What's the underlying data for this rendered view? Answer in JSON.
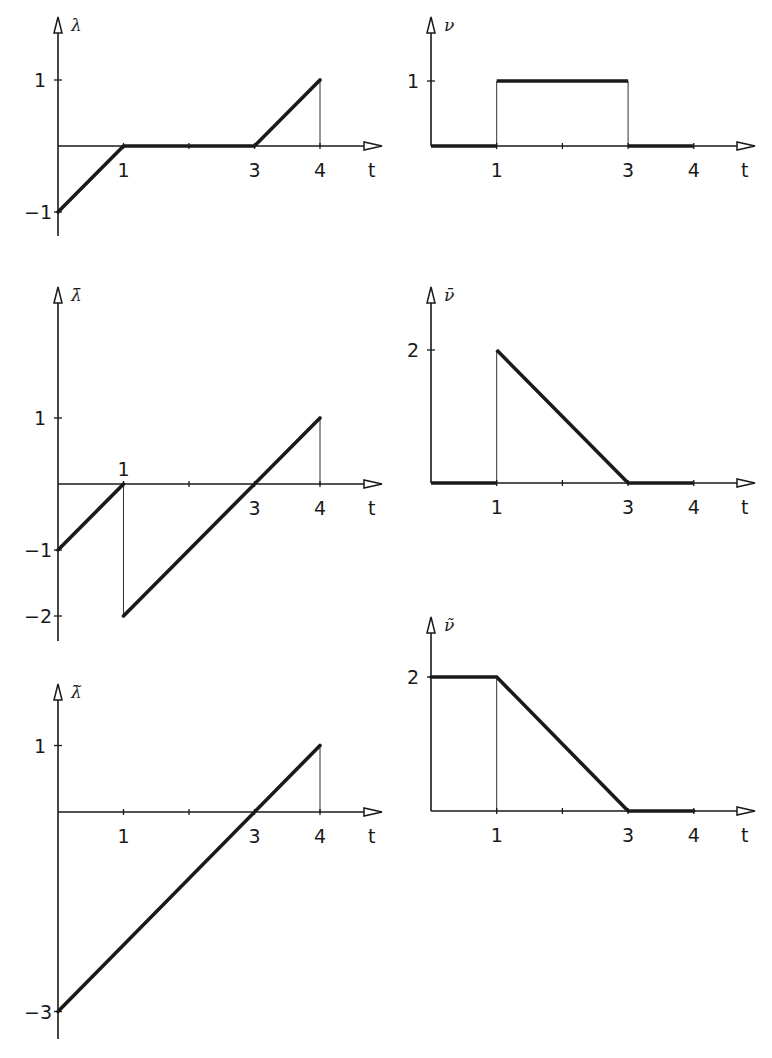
{
  "colors": {
    "ink": "#1a1a1a",
    "background": "#ffffff"
  },
  "chart_data": [
    {
      "id": "lambda",
      "type": "line",
      "title": "",
      "ylabel": "λ",
      "xlabel": "t",
      "x_ticks": [
        1,
        3,
        4
      ],
      "x_tick_labels": [
        "1",
        "3",
        "4"
      ],
      "y_ticks": [
        1,
        -1
      ],
      "y_tick_labels": [
        "1",
        "-1"
      ],
      "xlim": [
        0,
        4
      ],
      "ylim": [
        -1,
        1
      ],
      "x": [
        0,
        1,
        3,
        4
      ],
      "y": [
        -1,
        0,
        0,
        1
      ],
      "guides": [
        {
          "x": 4,
          "from": 0,
          "to": 1
        }
      ],
      "layout": {
        "ox": 58,
        "oy": 146,
        "sx": 65.5,
        "sy": 66,
        "ytop": 17,
        "ybot": 236,
        "xend": 382,
        "x_label_pos": "below",
        "x_label_row": 172
      }
    },
    {
      "id": "nu",
      "type": "line",
      "ylabel": "ν",
      "xlabel": "t",
      "x_ticks": [
        1,
        3,
        4
      ],
      "x_tick_labels": [
        "1",
        "3",
        "4"
      ],
      "y_ticks": [
        1
      ],
      "y_tick_labels": [
        "1"
      ],
      "xlim": [
        0,
        4
      ],
      "ylim": [
        0,
        1
      ],
      "x": [
        0,
        1,
        1,
        3,
        3,
        4
      ],
      "y": [
        0,
        0,
        1,
        1,
        0,
        0
      ],
      "guides": [
        {
          "x": 1,
          "from": 0,
          "to": 1
        },
        {
          "x": 3,
          "from": 0,
          "to": 1
        }
      ],
      "layout": {
        "ox": 431,
        "oy": 146,
        "sx": 65.7,
        "sy": 65,
        "ytop": 17,
        "ybot": 146,
        "xend": 755,
        "x_label_pos": "below",
        "x_label_row": 172
      }
    },
    {
      "id": "lambda_bar",
      "type": "line",
      "ylabel": "λ̄",
      "xlabel": "t",
      "x_ticks": [
        1,
        3,
        4
      ],
      "x_tick_labels": [
        "1",
        "3",
        "4"
      ],
      "y_ticks": [
        1,
        -1,
        -2
      ],
      "y_tick_labels": [
        "1",
        "-1",
        "-2"
      ],
      "xlim": [
        0,
        4
      ],
      "ylim": [
        -2,
        1
      ],
      "x": [
        0,
        1,
        1,
        4
      ],
      "y": [
        -1,
        0,
        -2,
        1
      ],
      "segments": [
        [
          [
            0,
            -1
          ],
          [
            1,
            0
          ]
        ],
        [
          [
            1,
            -2
          ],
          [
            4,
            1
          ]
        ]
      ],
      "guides": [
        {
          "x": 1,
          "from": 0,
          "to": -2
        },
        {
          "x": 4,
          "from": 0,
          "to": 1
        }
      ],
      "layout": {
        "ox": 58,
        "oy": 484,
        "sx": 65.5,
        "sy": 66,
        "ytop": 287,
        "ybot": 641,
        "xend": 382,
        "x_label_pos": "mixed",
        "x_label_row": 510
      }
    },
    {
      "id": "nu_bar",
      "type": "line",
      "ylabel": "ν̄",
      "xlabel": "t",
      "x_ticks": [
        1,
        3,
        4
      ],
      "x_tick_labels": [
        "1",
        "3",
        "4"
      ],
      "y_ticks": [
        2
      ],
      "y_tick_labels": [
        "2"
      ],
      "xlim": [
        0,
        4
      ],
      "ylim": [
        0,
        2
      ],
      "x": [
        0,
        1,
        1,
        3,
        4
      ],
      "y": [
        0,
        0,
        2,
        0,
        0
      ],
      "guides": [
        {
          "x": 1,
          "from": 0,
          "to": 2
        }
      ],
      "layout": {
        "ox": 431,
        "oy": 483,
        "sx": 65.7,
        "sy": 66.5,
        "ytop": 287,
        "ybot": 483,
        "xend": 755,
        "x_label_pos": "below",
        "x_label_row": 510
      }
    },
    {
      "id": "lambda_tilde",
      "type": "line",
      "ylabel": "λ̃",
      "xlabel": "t",
      "x_ticks": [
        1,
        3,
        4
      ],
      "x_tick_labels": [
        "1",
        "3",
        "4"
      ],
      "y_ticks": [
        1,
        -3
      ],
      "y_tick_labels": [
        "1",
        "-3"
      ],
      "xlim": [
        0,
        4
      ],
      "ylim": [
        -3,
        1
      ],
      "x": [
        0,
        4
      ],
      "y": [
        -3,
        1
      ],
      "guides": [
        {
          "x": 4,
          "from": 0,
          "to": 1
        }
      ],
      "layout": {
        "ox": 58,
        "oy": 812,
        "sx": 65.5,
        "sy": 66.5,
        "ytop": 684,
        "ybot": 1039,
        "xend": 382,
        "x_label_pos": "below",
        "x_label_row": 838
      }
    },
    {
      "id": "nu_tilde",
      "type": "line",
      "ylabel": "ν̃",
      "xlabel": "t",
      "x_ticks": [
        1,
        3,
        4
      ],
      "x_tick_labels": [
        "1",
        "3",
        "4"
      ],
      "y_ticks": [
        2
      ],
      "y_tick_labels": [
        "2"
      ],
      "xlim": [
        0,
        4
      ],
      "ylim": [
        0,
        2
      ],
      "x": [
        0,
        1,
        3,
        4
      ],
      "y": [
        2,
        2,
        0,
        0
      ],
      "guides": [
        {
          "x": 1,
          "from": 0,
          "to": 2
        }
      ],
      "layout": {
        "ox": 431,
        "oy": 811,
        "sx": 65.7,
        "sy": 67,
        "ytop": 617,
        "ybot": 811,
        "xend": 755,
        "x_label_pos": "below",
        "x_label_row": 838
      }
    }
  ]
}
